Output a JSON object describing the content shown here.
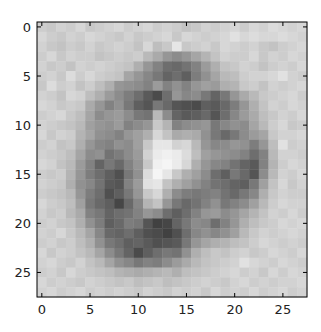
{
  "chart_data": {
    "type": "heatmap",
    "title": "",
    "xlabel": "",
    "ylabel": "",
    "colormap": "gray",
    "value_range": [
      0,
      255
    ],
    "xlim": [
      -0.5,
      27.5
    ],
    "ylim": [
      27.5,
      -0.5
    ],
    "x_ticks": [
      "0",
      "5",
      "10",
      "15",
      "20",
      "25"
    ],
    "x_tick_values": [
      0,
      5,
      10,
      15,
      20,
      25
    ],
    "y_ticks": [
      "0",
      "5",
      "10",
      "15",
      "20",
      "25"
    ],
    "y_tick_values": [
      0,
      5,
      10,
      15,
      20,
      25
    ],
    "grid": false,
    "rows": 28,
    "cols": 28,
    "values": [
      [
        205,
        200,
        210,
        205,
        215,
        200,
        205,
        210,
        215,
        205,
        210,
        215,
        205,
        210,
        205,
        195,
        200,
        210,
        205,
        210,
        215,
        205,
        215,
        210,
        220,
        215,
        210,
        215
      ],
      [
        215,
        205,
        200,
        210,
        205,
        215,
        210,
        205,
        200,
        210,
        200,
        205,
        210,
        215,
        200,
        215,
        210,
        205,
        210,
        215,
        225,
        215,
        220,
        215,
        215,
        220,
        215,
        210
      ],
      [
        210,
        200,
        195,
        205,
        200,
        210,
        200,
        205,
        210,
        205,
        195,
        215,
        190,
        200,
        230,
        200,
        205,
        210,
        200,
        215,
        210,
        205,
        210,
        200,
        195,
        205,
        210,
        215
      ],
      [
        205,
        215,
        200,
        210,
        205,
        205,
        195,
        200,
        205,
        200,
        205,
        185,
        170,
        150,
        140,
        150,
        165,
        180,
        195,
        210,
        205,
        205,
        215,
        200,
        210,
        205,
        215,
        210
      ],
      [
        210,
        200,
        205,
        195,
        210,
        205,
        210,
        205,
        200,
        195,
        175,
        150,
        130,
        110,
        105,
        115,
        130,
        155,
        175,
        195,
        200,
        210,
        205,
        195,
        205,
        210,
        205,
        215
      ],
      [
        205,
        210,
        200,
        220,
        205,
        215,
        205,
        200,
        195,
        165,
        150,
        135,
        120,
        100,
        110,
        95,
        125,
        145,
        165,
        185,
        190,
        205,
        210,
        210,
        215,
        225,
        210,
        205
      ],
      [
        200,
        220,
        205,
        210,
        195,
        205,
        190,
        175,
        150,
        145,
        140,
        130,
        155,
        130,
        145,
        130,
        150,
        160,
        155,
        175,
        180,
        200,
        205,
        195,
        210,
        205,
        210,
        215
      ],
      [
        210,
        205,
        195,
        215,
        210,
        190,
        175,
        155,
        140,
        125,
        110,
        90,
        75,
        110,
        150,
        135,
        140,
        120,
        100,
        120,
        150,
        170,
        185,
        200,
        205,
        210,
        215,
        205
      ],
      [
        215,
        210,
        200,
        205,
        200,
        170,
        150,
        130,
        145,
        120,
        95,
        85,
        120,
        105,
        85,
        80,
        75,
        95,
        90,
        105,
        125,
        150,
        175,
        195,
        210,
        205,
        215,
        210
      ],
      [
        205,
        210,
        215,
        200,
        190,
        165,
        140,
        150,
        155,
        140,
        120,
        115,
        185,
        140,
        100,
        90,
        95,
        105,
        85,
        110,
        135,
        155,
        170,
        190,
        200,
        210,
        205,
        215
      ],
      [
        210,
        205,
        200,
        195,
        185,
        160,
        150,
        145,
        155,
        130,
        140,
        150,
        200,
        180,
        130,
        140,
        145,
        150,
        120,
        135,
        145,
        140,
        165,
        185,
        205,
        215,
        200,
        205
      ],
      [
        215,
        200,
        210,
        205,
        180,
        165,
        145,
        140,
        130,
        150,
        160,
        175,
        215,
        195,
        170,
        175,
        170,
        145,
        120,
        105,
        120,
        140,
        155,
        165,
        200,
        210,
        210,
        215
      ],
      [
        205,
        210,
        195,
        200,
        175,
        150,
        135,
        130,
        145,
        140,
        160,
        200,
        230,
        230,
        210,
        215,
        185,
        150,
        135,
        140,
        150,
        145,
        125,
        150,
        190,
        225,
        205,
        210
      ],
      [
        210,
        205,
        200,
        190,
        165,
        140,
        145,
        115,
        125,
        140,
        155,
        210,
        235,
        240,
        235,
        220,
        190,
        160,
        150,
        145,
        140,
        130,
        110,
        130,
        185,
        210,
        210,
        205
      ],
      [
        215,
        210,
        195,
        185,
        155,
        130,
        100,
        120,
        105,
        130,
        150,
        200,
        240,
        245,
        235,
        215,
        175,
        150,
        135,
        130,
        115,
        100,
        90,
        130,
        180,
        205,
        215,
        210
      ],
      [
        205,
        200,
        205,
        180,
        150,
        125,
        110,
        95,
        80,
        120,
        145,
        220,
        245,
        230,
        200,
        175,
        160,
        140,
        110,
        95,
        120,
        105,
        85,
        140,
        185,
        210,
        205,
        215
      ],
      [
        210,
        205,
        200,
        175,
        145,
        135,
        115,
        90,
        85,
        130,
        155,
        225,
        230,
        195,
        175,
        160,
        145,
        130,
        115,
        110,
        100,
        95,
        120,
        160,
        195,
        215,
        200,
        210
      ],
      [
        205,
        200,
        195,
        185,
        150,
        125,
        110,
        80,
        95,
        120,
        150,
        200,
        215,
        175,
        140,
        125,
        120,
        125,
        130,
        115,
        105,
        120,
        135,
        175,
        200,
        210,
        205,
        205
      ],
      [
        215,
        205,
        200,
        190,
        160,
        120,
        105,
        95,
        70,
        105,
        135,
        180,
        195,
        150,
        120,
        105,
        115,
        130,
        145,
        120,
        130,
        140,
        160,
        185,
        205,
        215,
        210,
        210
      ],
      [
        210,
        200,
        205,
        185,
        170,
        130,
        120,
        100,
        110,
        115,
        130,
        150,
        140,
        110,
        95,
        110,
        130,
        150,
        155,
        140,
        150,
        165,
        180,
        195,
        210,
        205,
        215,
        205
      ],
      [
        205,
        210,
        200,
        195,
        175,
        145,
        125,
        95,
        105,
        125,
        120,
        85,
        65,
        70,
        100,
        120,
        140,
        135,
        110,
        130,
        150,
        175,
        190,
        200,
        205,
        215,
        210,
        215
      ],
      [
        210,
        205,
        215,
        200,
        185,
        165,
        135,
        105,
        100,
        110,
        95,
        80,
        75,
        65,
        80,
        110,
        135,
        145,
        135,
        145,
        160,
        185,
        200,
        210,
        205,
        210,
        215,
        210
      ],
      [
        205,
        210,
        200,
        205,
        190,
        175,
        145,
        120,
        110,
        95,
        100,
        90,
        80,
        85,
        90,
        120,
        150,
        165,
        175,
        180,
        190,
        195,
        205,
        215,
        210,
        205,
        210,
        205
      ],
      [
        215,
        200,
        210,
        205,
        195,
        185,
        165,
        140,
        120,
        100,
        75,
        95,
        110,
        120,
        115,
        145,
        175,
        190,
        200,
        195,
        205,
        210,
        200,
        205,
        215,
        210,
        205,
        215
      ],
      [
        210,
        215,
        205,
        200,
        210,
        195,
        185,
        165,
        145,
        135,
        120,
        130,
        125,
        140,
        155,
        170,
        185,
        195,
        200,
        205,
        210,
        225,
        215,
        210,
        205,
        215,
        210,
        205
      ],
      [
        205,
        210,
        200,
        215,
        205,
        200,
        195,
        190,
        180,
        175,
        170,
        175,
        180,
        185,
        175,
        190,
        195,
        200,
        205,
        210,
        215,
        205,
        210,
        200,
        215,
        205,
        215,
        210
      ],
      [
        215,
        205,
        210,
        205,
        200,
        210,
        205,
        200,
        195,
        200,
        190,
        195,
        200,
        190,
        195,
        200,
        205,
        210,
        205,
        200,
        210,
        215,
        205,
        210,
        205,
        210,
        210,
        215
      ],
      [
        210,
        215,
        205,
        210,
        215,
        205,
        210,
        205,
        210,
        205,
        200,
        210,
        205,
        200,
        210,
        205,
        210,
        200,
        215,
        205,
        210,
        205,
        215,
        205,
        210,
        215,
        205,
        210
      ]
    ]
  }
}
